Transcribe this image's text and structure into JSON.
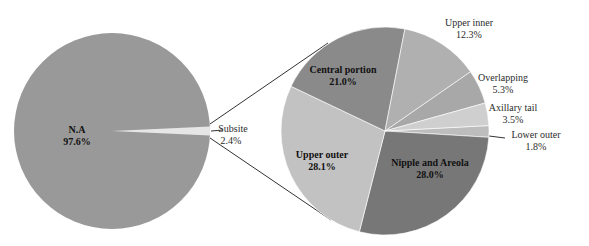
{
  "chart_data": [
    {
      "type": "pie",
      "title": "",
      "center": [
        112,
        131
      ],
      "radius": 98,
      "slices": [
        {
          "label": "N.A",
          "value": 97.6,
          "display": "97.6%",
          "color": "#999999"
        },
        {
          "label": "Subsite",
          "value": 2.4,
          "display": "2.4%",
          "color": "#e6e6e6"
        }
      ]
    },
    {
      "type": "pie",
      "title": "",
      "note": "Breakdown of 'Subsite' slice (pie-of-pie)",
      "center": [
        385,
        131
      ],
      "radius": 104,
      "slices": [
        {
          "label": "Lower outer",
          "value": 1.8,
          "display": "1.8%",
          "color": "#bdbdbd"
        },
        {
          "label": "Nipple and Areola",
          "value": 28.0,
          "display": "28.0%",
          "color": "#777777"
        },
        {
          "label": "Upper outer",
          "value": 28.1,
          "display": "28.1%",
          "color": "#c2c2c2"
        },
        {
          "label": "Central portion",
          "value": 21.0,
          "display": "21.0%",
          "color": "#8a8a8a"
        },
        {
          "label": "Upper inner",
          "value": 12.3,
          "display": "12.3%",
          "color": "#b0b0b0"
        },
        {
          "label": "Overlapping",
          "value": 5.3,
          "display": "5.3%",
          "color": "#a8a8a8"
        },
        {
          "label": "Axillary tail",
          "value": 3.5,
          "display": "3.5%",
          "color": "#cfcfcf"
        }
      ]
    }
  ],
  "labels": {
    "na": {
      "name": "N.A",
      "pct": "97.6%"
    },
    "subsite": {
      "name": "Subsite",
      "pct": "2.4%"
    },
    "central": {
      "name": "Central portion",
      "pct": "21.0%"
    },
    "upper_inner": {
      "name": "Upper inner",
      "pct": "12.3%"
    },
    "overlapping": {
      "name": "Overlapping",
      "pct": "5.3%"
    },
    "axillary": {
      "name": "Axillary tail",
      "pct": "3.5%"
    },
    "lower_outer": {
      "name": "Lower outer",
      "pct": "1.8%"
    },
    "upper_outer": {
      "name": "Upper outer",
      "pct": "28.1%"
    },
    "nipple": {
      "name": "Nipple and Areola",
      "pct": "28.0%"
    }
  }
}
